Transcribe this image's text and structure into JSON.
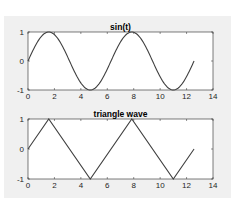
{
  "chart_data": [
    {
      "type": "line",
      "title": "sin(t)",
      "xlabel": "",
      "ylabel": "",
      "xlim": [
        0,
        14
      ],
      "ylim": [
        -1,
        1
      ],
      "xticks": [
        0,
        2,
        4,
        6,
        8,
        10,
        12,
        14
      ],
      "yticks": [
        -1,
        0,
        1
      ],
      "grid": false,
      "legend": null,
      "series": [
        {
          "name": "sin(t)",
          "color": "#404040",
          "function": "sin(t)",
          "x_range": [
            0,
            12.566
          ],
          "x": [
            0,
            1.5708,
            3.1416,
            4.7124,
            6.2832,
            7.854,
            9.4248,
            10.9956,
            12.5664
          ],
          "y": [
            0,
            1,
            0,
            -1,
            0,
            1,
            0,
            -1,
            0
          ]
        }
      ]
    },
    {
      "type": "line",
      "title": "triangle wave",
      "xlabel": "",
      "ylabel": "",
      "xlim": [
        0,
        14
      ],
      "ylim": [
        -1,
        1
      ],
      "xticks": [
        0,
        2,
        4,
        6,
        8,
        10,
        12,
        14
      ],
      "yticks": [
        -1,
        0,
        1
      ],
      "grid": false,
      "legend": null,
      "series": [
        {
          "name": "triangle wave",
          "color": "#404040",
          "x": [
            0,
            1.5708,
            4.7124,
            7.854,
            10.9956,
            12.5664
          ],
          "y": [
            0,
            1,
            -1,
            1,
            -1,
            0
          ]
        }
      ]
    }
  ],
  "plots": {
    "top": {
      "title": "sin(t)",
      "xtick_labels": [
        "0",
        "2",
        "4",
        "6",
        "8",
        "10",
        "12",
        "14"
      ],
      "ytick_labels": [
        "1",
        "0",
        "-1"
      ]
    },
    "bottom": {
      "title": "triangle wave",
      "xtick_labels": [
        "0",
        "2",
        "4",
        "6",
        "8",
        "10",
        "12",
        "14"
      ],
      "ytick_labels": [
        "1",
        "0",
        "-1"
      ]
    }
  },
  "colors": {
    "figure_bg": "#f0f0f0",
    "axes_bg": "#ffffff",
    "line": "#404040",
    "axes_edge": "#262626"
  }
}
